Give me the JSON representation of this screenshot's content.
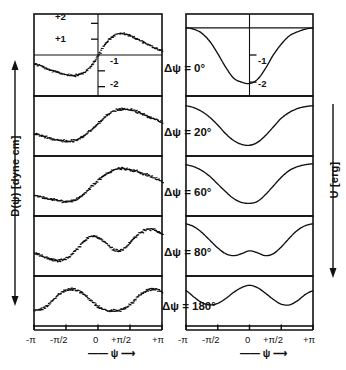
{
  "figure": {
    "y_axis_left": "D(ψ) [dyne cm]",
    "y_axis_right": "U [erg]",
    "x_axis_caption_left": "—— ψ ⟶",
    "x_axis_caption_right": "—— ψ ⟶",
    "x_ticks": [
      "-π",
      "-π/2",
      "0",
      "+π/2",
      "+π"
    ],
    "left_y_ticks": [
      "+2",
      "+1",
      "-1",
      "-2"
    ],
    "right_y_ticks": [
      "-1",
      "-2"
    ],
    "row_labels": [
      "Δψ = 0°",
      "Δψ = 20°",
      "Δψ = 60°",
      "Δψ = 80°",
      "Δψ = 180°"
    ],
    "colors": {
      "ink": "#111111",
      "background": "#ffffff"
    }
  },
  "chart_data": {
    "type": "line",
    "title": "",
    "xlabel": "ψ",
    "ylabel_left": "D(ψ) [dyne cm]",
    "ylabel_right": "U [erg]",
    "x": [
      -3.1416,
      -2.7489,
      -2.3562,
      -1.9635,
      -1.5708,
      -1.1781,
      -0.7854,
      -0.3927,
      0.0,
      0.3927,
      0.7854,
      1.1781,
      1.5708,
      1.9635,
      2.3562,
      2.7489,
      3.1416
    ],
    "xtick_values": [
      -3.1416,
      -1.5708,
      0.0,
      1.5708,
      3.1416
    ],
    "xtick_labels": [
      "-π",
      "-π/2",
      "0",
      "+π/2",
      "+π"
    ],
    "xlim": [
      -3.1416,
      3.1416
    ],
    "grid": false,
    "legend": "none",
    "panels": [
      {
        "row": 0,
        "delta_psi_deg": 0,
        "label": "Δψ = 0°",
        "left": {
          "name": "D(ψ)",
          "style": "dotted-noisy",
          "ylim": [
            -2.4,
            2.4
          ],
          "ytick_values": [
            2,
            1,
            -1,
            -2
          ],
          "ytick_labels": [
            "+2",
            "+1",
            "-1",
            "-2"
          ],
          "values": [
            -0.55,
            -0.75,
            -0.95,
            -1.1,
            -1.25,
            -1.3,
            -1.15,
            -0.75,
            0.0,
            0.8,
            1.25,
            1.35,
            1.2,
            0.95,
            0.7,
            0.45,
            0.25
          ]
        },
        "right": {
          "name": "U",
          "style": "smooth",
          "ylim": [
            -2.4,
            0.4
          ],
          "ytick_values": [
            -1,
            -2
          ],
          "ytick_labels": [
            "-1",
            "-2"
          ],
          "values": [
            0.0,
            -0.05,
            -0.2,
            -0.5,
            -0.95,
            -1.45,
            -1.85,
            -2.0,
            -2.05,
            -1.9,
            -1.5,
            -1.0,
            -0.6,
            -0.3,
            -0.15,
            -0.05,
            0.0
          ]
        }
      },
      {
        "row": 1,
        "delta_psi_deg": 20,
        "label": "Δψ = 20°",
        "left": {
          "name": "D(ψ)",
          "style": "dotted-noisy",
          "ylim": [
            -2.4,
            2.4
          ],
          "values": [
            -0.7,
            -0.9,
            -1.1,
            -1.25,
            -1.35,
            -1.3,
            -0.95,
            -0.4,
            0.25,
            0.9,
            1.35,
            1.5,
            1.45,
            1.2,
            0.9,
            0.6,
            0.35
          ]
        },
        "right": {
          "name": "U",
          "style": "smooth",
          "ylim": [
            -2.4,
            0.4
          ],
          "values": [
            0.05,
            -0.05,
            -0.25,
            -0.55,
            -0.95,
            -1.4,
            -1.75,
            -1.95,
            -2.0,
            -1.85,
            -1.5,
            -1.05,
            -0.6,
            -0.3,
            -0.1,
            0.0,
            0.05
          ]
        }
      },
      {
        "row": 2,
        "delta_psi_deg": 60,
        "label": "Δψ = 60°",
        "left": {
          "name": "D(ψ)",
          "style": "dotted-noisy",
          "ylim": [
            -2.4,
            2.4
          ],
          "values": [
            -0.85,
            -1.0,
            -1.15,
            -1.3,
            -1.4,
            -1.25,
            -0.8,
            -0.15,
            0.55,
            1.1,
            1.45,
            1.55,
            1.45,
            1.25,
            1.0,
            0.7,
            0.4
          ]
        },
        "right": {
          "name": "U",
          "style": "smooth",
          "ylim": [
            -2.4,
            0.4
          ],
          "values": [
            0.1,
            0.0,
            -0.2,
            -0.5,
            -0.9,
            -1.3,
            -1.65,
            -1.85,
            -1.9,
            -1.8,
            -1.45,
            -1.0,
            -0.55,
            -0.2,
            0.0,
            0.1,
            0.15
          ]
        }
      },
      {
        "row": 3,
        "delta_psi_deg": 80,
        "label": "Δψ = 80°",
        "left": {
          "name": "D(ψ)",
          "style": "dotted-noisy",
          "ylim": [
            -2.4,
            2.4
          ],
          "values": [
            -0.6,
            -0.95,
            -1.2,
            -1.3,
            -1.1,
            -0.5,
            0.3,
            0.85,
            0.75,
            0.2,
            -0.35,
            -0.3,
            0.35,
            1.05,
            1.45,
            1.4,
            1.0
          ]
        },
        "right": {
          "name": "U",
          "style": "smooth",
          "ylim": [
            -2.4,
            0.4
          ],
          "values": [
            0.15,
            0.0,
            -0.3,
            -0.7,
            -1.1,
            -1.4,
            -1.5,
            -1.4,
            -1.25,
            -1.35,
            -1.5,
            -1.4,
            -1.05,
            -0.6,
            -0.2,
            0.05,
            0.15
          ]
        }
      },
      {
        "row": 4,
        "delta_psi_deg": 180,
        "label": "Δψ = 180°",
        "left": {
          "name": "D(ψ)",
          "style": "dotted-noisy",
          "ylim": [
            -2.4,
            2.4
          ],
          "values": [
            -1.0,
            -0.85,
            -0.2,
            0.7,
            1.2,
            1.25,
            0.85,
            0.1,
            -0.65,
            -1.0,
            -1.05,
            -0.9,
            -0.35,
            0.5,
            1.15,
            1.3,
            1.0
          ]
        },
        "right": {
          "name": "U",
          "style": "smooth",
          "ylim": [
            -2.4,
            0.4
          ],
          "values": [
            -0.35,
            -0.75,
            -1.1,
            -1.25,
            -1.15,
            -0.85,
            -0.45,
            -0.15,
            0.0,
            -0.15,
            -0.5,
            -0.9,
            -1.2,
            -1.25,
            -1.0,
            -0.6,
            -0.35
          ]
        }
      }
    ]
  }
}
